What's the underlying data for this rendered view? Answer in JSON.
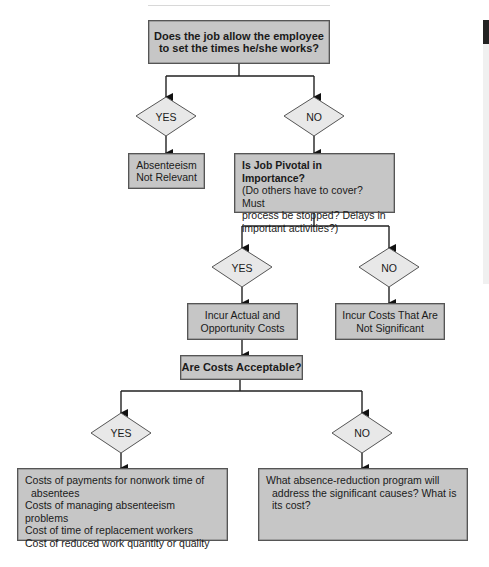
{
  "diagram": {
    "type": "flowchart",
    "nodes": {
      "q1": {
        "line1": "Does the job allow the employee",
        "line2": "to set the times he/she works?"
      },
      "d1_yes": "YES",
      "d1_no": "NO",
      "not_relevant": {
        "line1": "Absenteeism",
        "line2": "Not Relevant"
      },
      "q2": {
        "title": "Is Job Pivotal in Importance?",
        "line1": "(Do others have to cover? Must",
        "line2": "process be stopped? Delays in",
        "line3": "important activities?)"
      },
      "d2_yes": "YES",
      "d2_no": "NO",
      "incur_actual": {
        "line1": "Incur Actual and",
        "line2": "Opportunity Costs"
      },
      "incur_not_sig": {
        "line1": "Incur Costs That Are",
        "line2": "Not Significant"
      },
      "q3": "Are Costs Acceptable?",
      "d3_yes": "YES",
      "d3_no": "NO",
      "costs_list": {
        "items": [
          "Costs of payments for nonwork time of",
          "absentees",
          "Costs of managing absenteeism problems",
          "Cost of time of replacement workers",
          "Cost of reduced work quantity or quality"
        ]
      },
      "reduction_program": {
        "line1": "What absence-reduction program will",
        "line2": "address the significant causes? What is",
        "line3": "its cost?"
      }
    },
    "edges": [
      {
        "from": "q1",
        "to": "d1_yes"
      },
      {
        "from": "q1",
        "to": "d1_no"
      },
      {
        "from": "d1_yes",
        "to": "not_relevant"
      },
      {
        "from": "d1_no",
        "to": "q2"
      },
      {
        "from": "q2",
        "to": "d2_yes"
      },
      {
        "from": "q2",
        "to": "d2_no"
      },
      {
        "from": "d2_yes",
        "to": "incur_actual"
      },
      {
        "from": "d2_no",
        "to": "incur_not_sig"
      },
      {
        "from": "incur_actual",
        "to": "q3"
      },
      {
        "from": "q3",
        "to": "d3_yes"
      },
      {
        "from": "q3",
        "to": "d3_no"
      },
      {
        "from": "d3_yes",
        "to": "costs_list"
      },
      {
        "from": "d3_no",
        "to": "reduction_program"
      }
    ],
    "colors": {
      "box_fill": "#c6c6c6",
      "diamond_fill": "#e8e8e8",
      "line": "#222222"
    }
  }
}
